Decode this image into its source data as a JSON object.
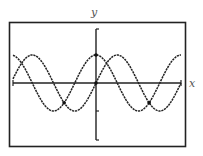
{
  "chart_data": {
    "type": "line",
    "title": "",
    "xlabel": "x",
    "ylabel": "y",
    "xlim": [
      -6.2832,
      6.2832
    ],
    "ylim": [
      -2,
      2
    ],
    "grid": false,
    "legend": null,
    "x_ticks": [],
    "y_ticks": [
      -2,
      -1,
      2
    ],
    "series": [
      {
        "name": "y = cos x",
        "function": "cos",
        "color": "#222222",
        "style": "dotted-solid"
      },
      {
        "name": "y = sin x",
        "function": "sin",
        "color": "#222222",
        "style": "dotted-solid"
      }
    ],
    "marked_points": [
      {
        "x": -2.3562,
        "y": -0.7071,
        "label": "intersection"
      },
      {
        "x": 3.927,
        "y": -0.7071,
        "label": "intersection"
      },
      {
        "x": 0,
        "y": 1,
        "label": "cos peak on y-axis"
      },
      {
        "x": 0,
        "y": 0,
        "label": "origin"
      }
    ]
  },
  "labels": {
    "x_axis": "x",
    "y_axis": "y"
  },
  "frame": {
    "stroke": "#222222"
  }
}
